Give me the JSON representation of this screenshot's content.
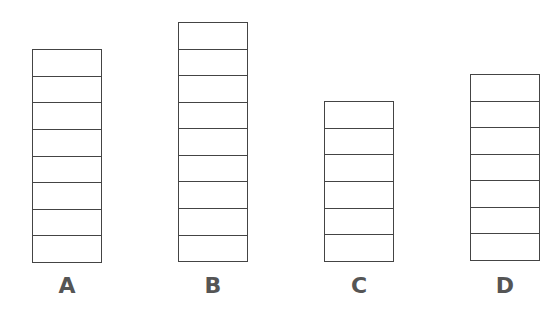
{
  "diagram": {
    "type": "stacked-block-towers",
    "stroke_color": "#444444",
    "label_color": "#555555",
    "background": "#ffffff",
    "stacks": [
      {
        "label": "A",
        "cells": 8,
        "left": 32,
        "top": 49,
        "height": 214
      },
      {
        "label": "B",
        "cells": 9,
        "left": 178,
        "top": 22,
        "height": 240
      },
      {
        "label": "C",
        "cells": 6,
        "left": 324,
        "top": 101,
        "height": 161
      },
      {
        "label": "D",
        "cells": 7,
        "left": 470,
        "top": 74,
        "height": 187
      }
    ]
  }
}
